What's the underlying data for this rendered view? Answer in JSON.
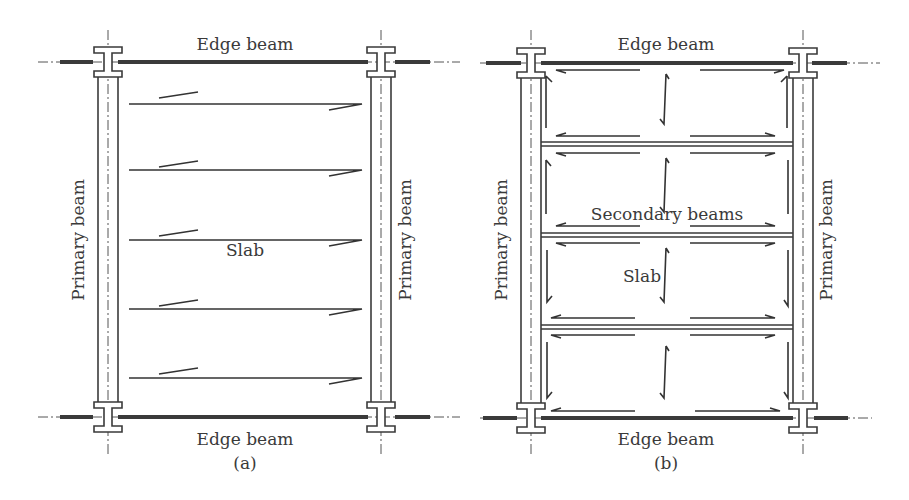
{
  "figure": {
    "panels": [
      {
        "id": "a",
        "caption": "(a)",
        "labels": {
          "top_edge": "Edge beam",
          "bottom_edge": "Edge beam",
          "left_primary": "Primary beam",
          "right_primary": "Primary beam",
          "slab": "Slab"
        },
        "span_direction": "one-way, spanning between primary beams",
        "arrow_count": 5
      },
      {
        "id": "b",
        "caption": "(b)",
        "labels": {
          "top_edge": "Edge beam",
          "bottom_edge": "Edge beam",
          "left_primary": "Primary beam",
          "right_primary": "Primary beam",
          "secondary": "Secondary beams",
          "slab": "Slab"
        },
        "secondary_beam_count": 3,
        "span_direction": "slab spans between secondary beams"
      }
    ],
    "colors": {
      "line": "#3a3a3a",
      "background": "#ffffff"
    }
  }
}
